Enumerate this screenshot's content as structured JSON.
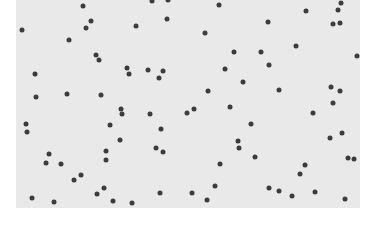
{
  "image": {
    "description": "Scatter of small dark dots on a light gray rectangular field",
    "background_color": "#ffffff",
    "field_color": "#e9e9e9",
    "dot_color": "#3c3c3c",
    "field": {
      "x": 16,
      "y": 0,
      "width": 344,
      "height": 208
    },
    "dots": [
      [
        83,
        6
      ],
      [
        152,
        1
      ],
      [
        168,
        0
      ],
      [
        91,
        21
      ],
      [
        86,
        28
      ],
      [
        167,
        19
      ],
      [
        22,
        30
      ],
      [
        136,
        26
      ],
      [
        69,
        40
      ],
      [
        96,
        55
      ],
      [
        99,
        60
      ],
      [
        35,
        74
      ],
      [
        127,
        68
      ],
      [
        129,
        74
      ],
      [
        148,
        70
      ],
      [
        163,
        71
      ],
      [
        159,
        78
      ],
      [
        36,
        97
      ],
      [
        67,
        94
      ],
      [
        101,
        95
      ],
      [
        121,
        109
      ],
      [
        122,
        114
      ],
      [
        150,
        114
      ],
      [
        219,
        5
      ],
      [
        341,
        3
      ],
      [
        306,
        11
      ],
      [
        338,
        10
      ],
      [
        268,
        22
      ],
      [
        333,
        24
      ],
      [
        340,
        23
      ],
      [
        205,
        33
      ],
      [
        234,
        52
      ],
      [
        261,
        52
      ],
      [
        296,
        46
      ],
      [
        357,
        56
      ],
      [
        269,
        65
      ],
      [
        225,
        69
      ],
      [
        243,
        82
      ],
      [
        208,
        91
      ],
      [
        279,
        90
      ],
      [
        331,
        87
      ],
      [
        340,
        91
      ],
      [
        333,
        103
      ],
      [
        194,
        109
      ],
      [
        187,
        113
      ],
      [
        230,
        107
      ],
      [
        313,
        113
      ],
      [
        26,
        124
      ],
      [
        27,
        132
      ],
      [
        110,
        125
      ],
      [
        161,
        129
      ],
      [
        120,
        140
      ],
      [
        106,
        151
      ],
      [
        106,
        160
      ],
      [
        156,
        148
      ],
      [
        163,
        152
      ],
      [
        49,
        154
      ],
      [
        46,
        163
      ],
      [
        61,
        164
      ],
      [
        81,
        175
      ],
      [
        74,
        180
      ],
      [
        104,
        188
      ],
      [
        97,
        194
      ],
      [
        160,
        193
      ],
      [
        32,
        198
      ],
      [
        54,
        202
      ],
      [
        113,
        201
      ],
      [
        132,
        203
      ],
      [
        251,
        124
      ],
      [
        238,
        141
      ],
      [
        239,
        148
      ],
      [
        255,
        157
      ],
      [
        220,
        164
      ],
      [
        330,
        138
      ],
      [
        342,
        133
      ],
      [
        348,
        158
      ],
      [
        354,
        159
      ],
      [
        305,
        165
      ],
      [
        300,
        174
      ],
      [
        215,
        186
      ],
      [
        192,
        193
      ],
      [
        207,
        200
      ],
      [
        269,
        188
      ],
      [
        279,
        191
      ],
      [
        292,
        196
      ],
      [
        315,
        192
      ],
      [
        345,
        199
      ]
    ]
  }
}
